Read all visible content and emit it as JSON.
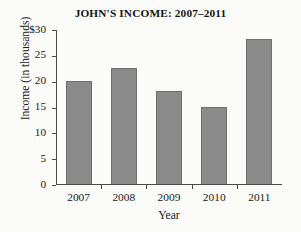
{
  "chart_data": {
    "type": "bar",
    "title": "JOHN'S INCOME: 2007–2011",
    "xlabel": "Year",
    "ylabel": "Income  (in thousands)",
    "categories": [
      "2007",
      "2008",
      "2009",
      "2010",
      "2011"
    ],
    "values": [
      20,
      22.5,
      18,
      15,
      28
    ],
    "ylim": [
      0,
      30
    ],
    "ytick_values": [
      0,
      5,
      10,
      15,
      20,
      25,
      30
    ],
    "ytick_labels": [
      "0",
      "5",
      "10",
      "15",
      "20",
      "25",
      "$30"
    ],
    "grid": false,
    "legend": null,
    "legend_position": "none",
    "bar_color": "#8a8a8a",
    "bar_edge_color": "#6f6f6f",
    "axis_color": "#4a4a4a",
    "background_color": "#fbfbfa",
    "currency_symbol": "$",
    "units": "thousands"
  }
}
